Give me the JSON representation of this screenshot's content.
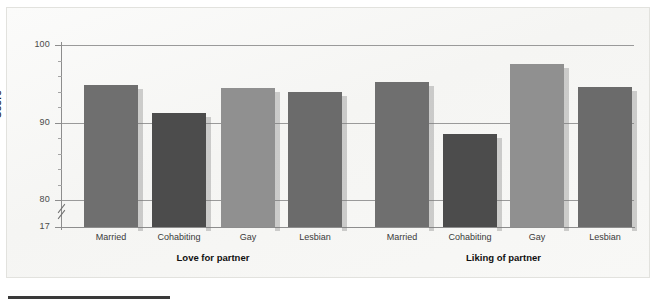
{
  "chart_data": {
    "type": "bar",
    "title": "",
    "subtitle": "",
    "xlabel": "",
    "ylabel": "Score",
    "ylim": [
      17,
      100
    ],
    "y_axis_break": true,
    "y_break_between": [
      17,
      80
    ],
    "grid": true,
    "gridlines": [
      80,
      90,
      100
    ],
    "ytick_labels": [
      "100",
      "90",
      "80",
      "17"
    ],
    "ytick_values": [
      100,
      90,
      80,
      17
    ],
    "minor_tick_step": 2,
    "legend": "none",
    "categories": [
      "Married",
      "Cohabiting",
      "Gay",
      "Lesbian"
    ],
    "groups": [
      {
        "name": "Love for partner",
        "label": "Love for partner",
        "bars": [
          {
            "category": "Married",
            "value": 94.9,
            "color": "#6f6f6f"
          },
          {
            "category": "Cohabiting",
            "value": 91.2,
            "color": "#4c4c4c"
          },
          {
            "category": "Gay",
            "value": 94.5,
            "color": "#909090"
          },
          {
            "category": "Lesbian",
            "value": 94.0,
            "color": "#6b6b6b"
          }
        ]
      },
      {
        "name": "Liking of partner",
        "label": "Liking of partner",
        "bars": [
          {
            "category": "Married",
            "value": 95.2,
            "color": "#6f6f6f"
          },
          {
            "category": "Cohabiting",
            "value": 88.5,
            "color": "#4c4c4c"
          },
          {
            "category": "Gay",
            "value": 97.6,
            "color": "#909090"
          },
          {
            "category": "Lesbian",
            "value": 94.6,
            "color": "#6b6b6b"
          }
        ]
      }
    ]
  },
  "figure": {
    "background_color": "#f7f7f5",
    "frame_color": "#e2e2de",
    "axis_color": "#8d8d8d",
    "gridline_color": "#9a9a9a"
  }
}
